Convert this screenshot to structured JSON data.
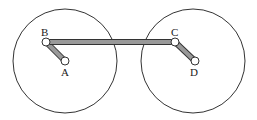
{
  "diagram": {
    "type": "linkage-mechanism",
    "colors": {
      "stroke": "#333333",
      "bar_fill": "#999999",
      "joint_fill": "#ffffff",
      "background": "#ffffff"
    },
    "circles": [
      {
        "id": "left-wheel",
        "cx": 65,
        "cy": 61,
        "r": 52
      },
      {
        "id": "right-wheel",
        "cx": 193,
        "cy": 61,
        "r": 52
      }
    ],
    "points": {
      "A": {
        "label": "A",
        "x": 65,
        "y": 61
      },
      "B": {
        "label": "B",
        "x": 46,
        "y": 42
      },
      "C": {
        "label": "C",
        "x": 175,
        "y": 42
      },
      "D": {
        "label": "D",
        "x": 195,
        "y": 61
      }
    },
    "links": [
      {
        "id": "AB",
        "from": "A",
        "to": "B"
      },
      {
        "id": "BC",
        "from": "B",
        "to": "C"
      },
      {
        "id": "CD",
        "from": "C",
        "to": "D"
      }
    ]
  }
}
